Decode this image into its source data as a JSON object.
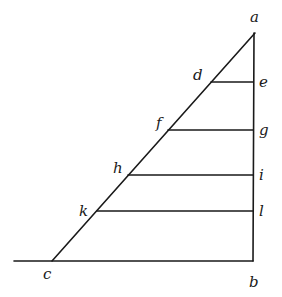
{
  "diagram": {
    "type": "geometric-figure",
    "stroke_color": "#1a1a1a",
    "background": "#ffffff",
    "points": {
      "a": {
        "x": 255,
        "y": 33,
        "label": "a",
        "lx": 250,
        "ly": 22
      },
      "b": {
        "x": 253,
        "y": 261,
        "label": "b",
        "lx": 249,
        "ly": 287
      },
      "c": {
        "x": 52,
        "y": 261,
        "label": "c",
        "lx": 43,
        "ly": 279
      },
      "d": {
        "x": 211,
        "y": 82,
        "label": "d",
        "lx": 193,
        "ly": 80
      },
      "e": {
        "x": 253,
        "y": 82,
        "label": "e",
        "lx": 259,
        "ly": 87
      },
      "f": {
        "x": 168,
        "y": 130,
        "label": "f",
        "lx": 156,
        "ly": 128
      },
      "g": {
        "x": 253,
        "y": 130,
        "label": "g",
        "lx": 259,
        "ly": 135
      },
      "h": {
        "x": 128,
        "y": 175,
        "label": "h",
        "lx": 113,
        "ly": 173
      },
      "i": {
        "x": 253,
        "y": 175,
        "label": "i",
        "lx": 259,
        "ly": 180
      },
      "k": {
        "x": 97,
        "y": 211,
        "label": "k",
        "lx": 79,
        "ly": 216
      },
      "l": {
        "x": 253,
        "y": 211,
        "label": "l",
        "lx": 259,
        "ly": 216
      }
    },
    "segments": [
      {
        "name": "hypotenuse-ac",
        "from": "a",
        "to": "c"
      },
      {
        "name": "vertical-ab",
        "from": "a",
        "to": "b"
      },
      {
        "name": "base-cb",
        "x1": 14,
        "y1": 261,
        "x2": 253,
        "y2": 261
      },
      {
        "name": "parallel-de",
        "from": "d",
        "to": "e"
      },
      {
        "name": "parallel-fg",
        "from": "f",
        "to": "g"
      },
      {
        "name": "parallel-hi",
        "from": "h",
        "to": "i"
      },
      {
        "name": "parallel-kl",
        "from": "k",
        "to": "l"
      }
    ]
  }
}
